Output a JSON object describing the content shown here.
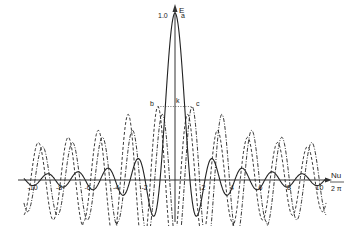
{
  "chart_data": {
    "type": "line",
    "title": "",
    "xlabel": "Nu / 2π",
    "ylabel": "E",
    "xlim": [
      -11,
      11
    ],
    "ylim": [
      -0.35,
      1.05
    ],
    "grid": false,
    "legend": null,
    "x_ticks": [
      -10,
      -8,
      -6,
      -4,
      -2,
      2,
      4,
      6,
      8,
      10
    ],
    "x_tick_labels": [
      "-10",
      "-8",
      "-6",
      "-4",
      "-2",
      "2",
      "4",
      "6",
      "8",
      "10"
    ],
    "y_tick_labels": [
      "1.0"
    ],
    "series": [
      {
        "name": "a (solid)",
        "style": "solid",
        "description": "sinc-like diffraction amplitude, central peak E=1.0 at x=0, oscillating side lobes decaying outward"
      },
      {
        "name": "b (dashed)",
        "style": "dashed",
        "description": "shifted sinc-like curve peaking near x=-1.2 at E≈0.44"
      },
      {
        "name": "c (dash-dot)",
        "style": "dashdot",
        "description": "shifted sinc-like curve peaking near x=+1.2 at E≈0.44"
      }
    ],
    "annotations": [
      {
        "text": "a",
        "x": 0.5,
        "y": 1.0
      },
      {
        "text": "b",
        "x": -1.4,
        "y": 0.45
      },
      {
        "text": "k",
        "x": 0.1,
        "y": 0.45
      },
      {
        "text": "c",
        "x": 1.5,
        "y": 0.45
      },
      {
        "text": "1.0",
        "x": -0.5,
        "y": 1.0
      }
    ],
    "reference_line": {
      "style": "dotted",
      "y": 0.44,
      "x_from": -1.2,
      "x_to": 1.2
    }
  },
  "labels": {
    "y_axis": "E",
    "x_axis_num": "Nu",
    "x_axis_den": "2 π",
    "peak_value": "1.0",
    "point_a": "a",
    "point_b": "b",
    "point_k": "k",
    "point_c": "c"
  }
}
